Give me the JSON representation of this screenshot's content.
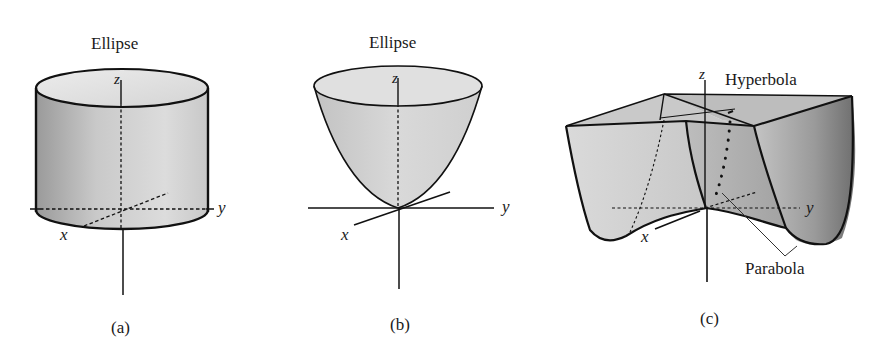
{
  "figures": [
    {
      "id": "a",
      "caption": "(a)",
      "surface": "elliptic cylinder",
      "trace_label": "Ellipse",
      "axes": {
        "x": "x",
        "y": "y",
        "z": "z"
      }
    },
    {
      "id": "b",
      "caption": "(b)",
      "surface": "elliptic paraboloid",
      "trace_label": "Ellipse",
      "axes": {
        "x": "x",
        "y": "y",
        "z": "z"
      }
    },
    {
      "id": "c",
      "caption": "(c)",
      "surface": "hyperbolic paraboloid",
      "trace_labels": [
        "Hyperbola",
        "Parabola"
      ],
      "axes": {
        "x": "x",
        "y": "y",
        "z": "z"
      }
    }
  ],
  "colors": {
    "background": "#ffffff",
    "outline": "#111111",
    "surface_light": "#e4e4e4",
    "surface_mid": "#c4c4c4",
    "surface_dark": "#8a8a8a"
  }
}
